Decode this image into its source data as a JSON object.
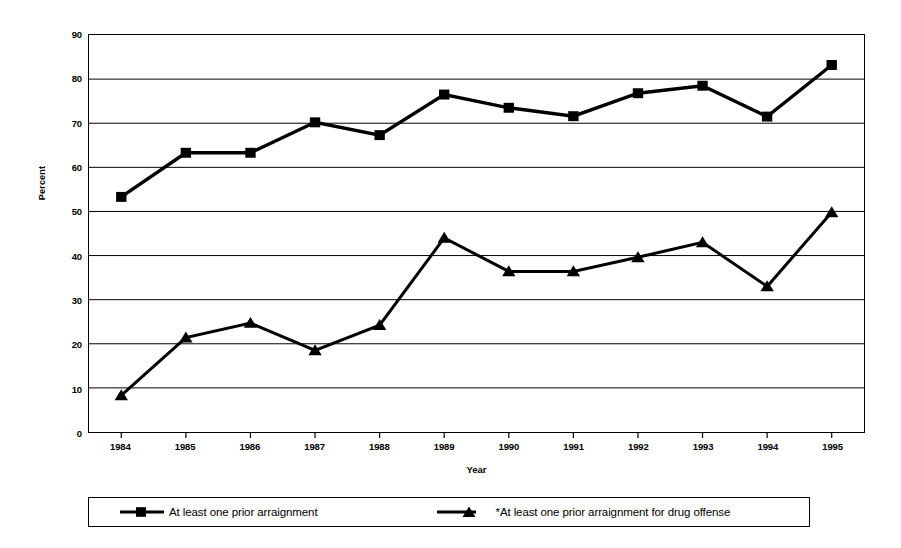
{
  "chart_data": {
    "type": "line",
    "title": "",
    "xlabel": "Year",
    "ylabel": "Percent",
    "categories": [
      "1984",
      "1985",
      "1986",
      "1987",
      "1988",
      "1989",
      "1990",
      "1991",
      "1992",
      "1993",
      "1994",
      "1995"
    ],
    "x": [
      1984,
      1985,
      1986,
      1987,
      1988,
      1989,
      1990,
      1991,
      1992,
      1993,
      1994,
      1995
    ],
    "ylim": [
      0,
      90
    ],
    "yticks": [
      0,
      10,
      20,
      30,
      40,
      50,
      60,
      70,
      80,
      90
    ],
    "grid": true,
    "legend_position": "bottom",
    "series": [
      {
        "name": "At least one prior arraignment",
        "marker": "square",
        "color": "#000000",
        "values": [
          53.3,
          63.3,
          63.3,
          70.2,
          67.3,
          76.5,
          73.5,
          71.6,
          76.8,
          78.5,
          71.5,
          83.2
        ]
      },
      {
        "name": "*At least one prior arraignment for drug offense",
        "marker": "triangle",
        "color": "#000000",
        "values": [
          8.3,
          21.4,
          24.7,
          18.5,
          24.2,
          44.0,
          36.4,
          36.4,
          39.6,
          43.0,
          33.0,
          49.8
        ]
      }
    ]
  },
  "axes": {
    "y_title": "Percent",
    "x_title": "Year",
    "y_tick_labels": [
      "90",
      "80",
      "70",
      "60",
      "50",
      "40",
      "30",
      "20",
      "10",
      "0"
    ],
    "x_tick_labels": [
      "1984",
      "1985",
      "1986",
      "1987",
      "1988",
      "1989",
      "1990",
      "1991",
      "1992",
      "1993",
      "1994",
      "1995"
    ]
  },
  "legend": {
    "entries": [
      {
        "label": "At least one prior arraignment",
        "marker": "square-marker-icon"
      },
      {
        "label": "*At least one prior arraignment for drug offense",
        "marker": "triangle-marker-icon"
      }
    ]
  },
  "colors": {
    "line": "#000000",
    "grid": "#000000",
    "background": "#ffffff"
  }
}
